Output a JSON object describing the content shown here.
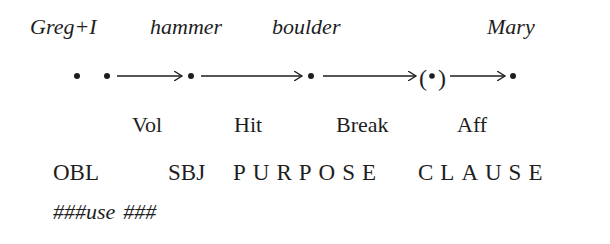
{
  "participants": [
    "Greg+I",
    "hammer",
    "boulder",
    "Mary"
  ],
  "chain": {
    "nodes": [
      {
        "label": "dot",
        "parenthesized": false
      },
      {
        "label": "dot",
        "parenthesized": false
      },
      {
        "label": "dot",
        "parenthesized": false
      },
      {
        "label": "dot",
        "parenthesized": false
      },
      {
        "label": "dot",
        "parenthesized": true
      },
      {
        "label": "dot",
        "parenthesized": false
      }
    ],
    "arrows": [
      {
        "from": 1,
        "to": 2
      },
      {
        "from": 2,
        "to": 3
      },
      {
        "from": 3,
        "to": 4
      },
      {
        "from": 4,
        "to": 5
      }
    ],
    "paren_open": "(",
    "paren_close": ")"
  },
  "relations": [
    "Vol",
    "Hit",
    "Break",
    "Aff"
  ],
  "functions": {
    "obl": "OBL",
    "sbj": "SBJ",
    "purpose": "PURPOSE",
    "clause": "CLAUSE"
  },
  "verb_line": {
    "prefix": "###",
    "verb": "use",
    "suffix": "###"
  }
}
